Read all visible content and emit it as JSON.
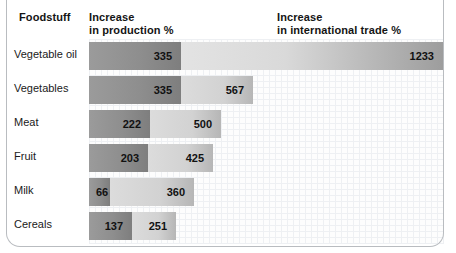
{
  "header": {
    "foodstuff": "Foodstuff",
    "production": "Increase\nin production %",
    "trade": "Increase\nin international trade %"
  },
  "chart_data": {
    "type": "bar",
    "title": "",
    "xlabel": "",
    "ylabel": "Foodstuff",
    "orientation": "horizontal",
    "stacked": true,
    "grid": true,
    "legend": "column headers",
    "categories": [
      "Vegetable oil",
      "Vegetables",
      "Meat",
      "Fruit",
      "Milk",
      "Cereals"
    ],
    "series": [
      {
        "name": "Increase in production %",
        "values": [
          335,
          335,
          222,
          203,
          66,
          137
        ]
      },
      {
        "name": "Increase in international trade %",
        "values": [
          1233,
          567,
          500,
          425,
          360,
          251
        ]
      }
    ],
    "note": "Bar lengths are pictorial and not drawn to a single common scale."
  },
  "rows": [
    {
      "label": "Vegetable oil",
      "production": "335",
      "trade": "1233",
      "dark_px": 92,
      "light_px": 262,
      "value_pos": "right"
    },
    {
      "label": "Vegetables",
      "production": "335",
      "trade": "567",
      "dark_px": 92,
      "light_px": 72,
      "value_pos": "right"
    },
    {
      "label": "Meat",
      "production": "222",
      "trade": "500",
      "dark_px": 61,
      "light_px": 71,
      "value_pos": "right"
    },
    {
      "label": "Fruit",
      "production": "203",
      "trade": "425",
      "dark_px": 59,
      "light_px": 65,
      "value_pos": "right"
    },
    {
      "label": "Milk",
      "production": "66",
      "trade": "360",
      "dark_px": 21,
      "light_px": 84,
      "value_pos": "left"
    },
    {
      "label": "Cereals",
      "production": "137",
      "trade": "251",
      "dark_px": 43,
      "light_px": 44,
      "value_pos": "right"
    }
  ],
  "colors": {
    "production_bar": "#8e8e8e",
    "trade_bar": "#d2d2d2",
    "grid": "#eef0f3",
    "frame": "#b9bcc0",
    "text": "#1a1a1a"
  }
}
